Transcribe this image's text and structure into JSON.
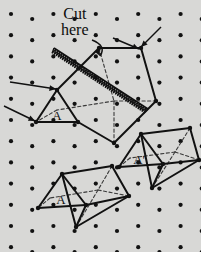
{
  "figure": {
    "background_color": "#d8d8d6",
    "border_color": "#ffffff",
    "ink_color": "#111111",
    "dashed_color": "#3a3a3a",
    "dot_color": "#121212",
    "annotation": {
      "line1": "Cut",
      "line2": "here"
    },
    "labels": {
      "a_main": "A",
      "a_bottom": "A",
      "a_prime": "A'"
    },
    "grid": {
      "dot_radius": 2.1,
      "col_spacing": 21.2,
      "row_spacing": 21.2,
      "col_y_offset": 5.0,
      "origin_x": 11,
      "origin_y": 14,
      "cols": 10,
      "rows": 12
    },
    "shapes": {
      "main_prism": {
        "name": "large-triangular-prism",
        "front_triangle": [
          [
            36,
            122
          ],
          [
            57,
            90
          ],
          [
            78,
            122
          ]
        ],
        "body_outline": [
          [
            36,
            122
          ],
          [
            57,
            90
          ],
          [
            99,
            48
          ],
          [
            141,
            48
          ],
          [
            156,
            101
          ],
          [
            114,
            143
          ],
          [
            78,
            122
          ]
        ],
        "solid_edges": [
          [
            [
              36,
              122
            ],
            [
              57,
              90
            ]
          ],
          [
            [
              57,
              90
            ],
            [
              78,
              122
            ]
          ],
          [
            [
              36,
              122
            ],
            [
              78,
              122
            ]
          ],
          [
            [
              57,
              90
            ],
            [
              99,
              48
            ]
          ],
          [
            [
              99,
              48
            ],
            [
              141,
              48
            ]
          ],
          [
            [
              141,
              48
            ],
            [
              156,
              101
            ]
          ],
          [
            [
              156,
              101
            ],
            [
              114,
              143
            ]
          ],
          [
            [
              114,
              143
            ],
            [
              78,
              122
            ]
          ],
          [
            [
              36,
              122
            ],
            [
              78,
              122
            ]
          ]
        ],
        "dashed_edges": [
          [
            [
              99,
              48
            ],
            [
              114,
              101
            ]
          ],
          [
            [
              114,
              101
            ],
            [
              156,
              101
            ]
          ],
          [
            [
              114,
              101
            ],
            [
              114,
              143
            ]
          ],
          [
            [
              114,
              101
            ],
            [
              57,
              110
            ]
          ],
          [
            [
              57,
              110
            ],
            [
              36,
              122
            ]
          ]
        ]
      },
      "bottom_prism": {
        "name": "bottom-left-prism",
        "solid_edges": [
          [
            [
              38,
              208
            ],
            [
              62,
              174
            ]
          ],
          [
            [
              62,
              174
            ],
            [
              86,
              205
            ]
          ],
          [
            [
              38,
              208
            ],
            [
              86,
              205
            ]
          ],
          [
            [
              62,
              174
            ],
            [
              112,
              166
            ]
          ],
          [
            [
              112,
              166
            ],
            [
              129,
              196
            ]
          ],
          [
            [
              129,
              196
            ],
            [
              86,
              205
            ]
          ],
          [
            [
              86,
              205
            ],
            [
              76,
              227
            ]
          ],
          [
            [
              76,
              227
            ],
            [
              129,
              196
            ]
          ],
          [
            [
              62,
              174
            ],
            [
              76,
              227
            ]
          ]
        ],
        "dashed_edges": [
          [
            [
              112,
              166
            ],
            [
              98,
              190
            ]
          ],
          [
            [
              98,
              190
            ],
            [
              129,
              196
            ]
          ],
          [
            [
              98,
              190
            ],
            [
              76,
              227
            ]
          ],
          [
            [
              98,
              190
            ],
            [
              50,
              198
            ]
          ],
          [
            [
              50,
              198
            ],
            [
              38,
              208
            ]
          ]
        ]
      },
      "right_prism": {
        "name": "bottom-right-prism",
        "solid_edges": [
          [
            [
              119,
              167
            ],
            [
              141,
              134
            ]
          ],
          [
            [
              141,
              134
            ],
            [
              163,
              164
            ]
          ],
          [
            [
              119,
              167
            ],
            [
              163,
              164
            ]
          ],
          [
            [
              141,
              134
            ],
            [
              190,
              128
            ]
          ],
          [
            [
              190,
              128
            ],
            [
              199,
              160
            ]
          ],
          [
            [
              199,
              160
            ],
            [
              163,
              164
            ]
          ],
          [
            [
              163,
              164
            ],
            [
              152,
              188
            ]
          ],
          [
            [
              152,
              188
            ],
            [
              199,
              160
            ]
          ],
          [
            [
              141,
              134
            ],
            [
              152,
              188
            ]
          ]
        ],
        "dashed_edges": [
          [
            [
              190,
              128
            ],
            [
              175,
              152
            ]
          ],
          [
            [
              175,
              152
            ],
            [
              199,
              160
            ]
          ],
          [
            [
              175,
              152
            ],
            [
              152,
              188
            ]
          ],
          [
            [
              175,
              152
            ],
            [
              130,
              158
            ]
          ],
          [
            [
              130,
              158
            ],
            [
              119,
              167
            ]
          ]
        ]
      },
      "cut_line": {
        "name": "zigzag-cut-line",
        "start": [
          54,
          48
        ],
        "end": [
          148,
          109
        ],
        "amplitude": 5.5,
        "teeth": 46
      },
      "arrows": [
        {
          "name": "arrow-to-top-right-vertex",
          "from": [
            161,
            27
          ],
          "to": [
            141,
            47
          ]
        },
        {
          "name": "arrow-to-top-right-vertex-2",
          "from": [
            113,
            38
          ],
          "to": [
            139,
            49
          ]
        },
        {
          "name": "arrow-to-left-vertex",
          "from": [
            10,
            82
          ],
          "to": [
            56,
            89
          ]
        },
        {
          "name": "arrow-to-bottom-left-vertex",
          "from": [
            4,
            106
          ],
          "to": [
            35,
            121
          ]
        },
        {
          "name": "curved-arrow-cut",
          "from": [
            92,
            40
          ],
          "to": [
            100,
            56
          ]
        }
      ]
    }
  }
}
